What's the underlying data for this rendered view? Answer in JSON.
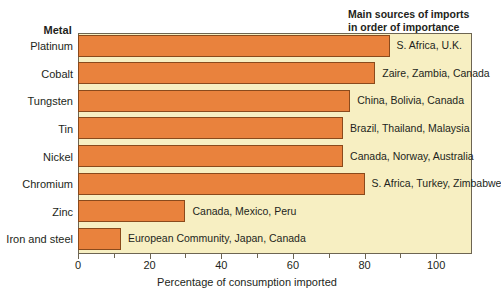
{
  "chart_data": {
    "type": "bar",
    "orientation": "horizontal",
    "title": "",
    "xlabel": "Percentage of consumption imported",
    "ylabel": "Metal",
    "xlim": [
      0,
      110
    ],
    "ylim": null,
    "grid": false,
    "legend": null,
    "xticks": [
      0,
      20,
      40,
      60,
      80,
      100
    ],
    "xtick_labels": [
      "0",
      "20",
      "40",
      "60",
      "80",
      "100"
    ],
    "minor_xticks": [
      10,
      30,
      50,
      70,
      90
    ],
    "categories": [
      "Platinum",
      "Cobalt",
      "Tungsten",
      "Tin",
      "Nickel",
      "Chromium",
      "Zinc",
      "Iron and steel"
    ],
    "values": [
      87,
      83,
      76,
      74,
      74,
      80,
      30,
      12
    ],
    "annotations": [
      "S. Africa, U.K.",
      "Zaire, Zambia, Canada",
      "China, Bolivia, Canada",
      "Brazil, Thailand, Malaysia",
      "Canada, Norway, Australia",
      "S. Africa, Turkey, Zimbabwe",
      "Canada, Mexico, Peru",
      "European Community, Japan, Canada"
    ],
    "bar_color": "#e9823d",
    "bar_edge_color": "#8a4a1c",
    "panel_color": "#f7efc2",
    "axis_color": "#6d6552"
  },
  "headers": {
    "metal": "Metal",
    "sources_line1": "Main sources of imports",
    "sources_line2": "in order of importance"
  }
}
